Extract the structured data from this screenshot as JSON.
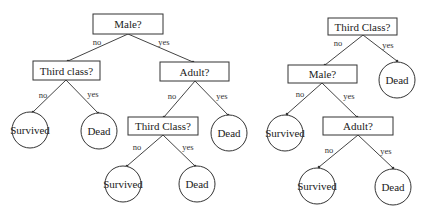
{
  "trees": [
    {
      "name": "tree-left",
      "nodes": [
        {
          "id": "male",
          "type": "decision",
          "label": "Male?"
        },
        {
          "id": "third_class_1",
          "type": "decision",
          "label": "Third class?"
        },
        {
          "id": "adult",
          "type": "decision",
          "label": "Adult?"
        },
        {
          "id": "survived_1",
          "type": "leaf",
          "label": "Survived"
        },
        {
          "id": "dead_1",
          "type": "leaf",
          "label": "Dead"
        },
        {
          "id": "third_class_2",
          "type": "decision",
          "label": "Third Class?"
        },
        {
          "id": "dead_2",
          "type": "leaf",
          "label": "Dead"
        },
        {
          "id": "survived_2",
          "type": "leaf",
          "label": "Survived"
        },
        {
          "id": "dead_3",
          "type": "leaf",
          "label": "Dead"
        }
      ],
      "edges": [
        {
          "from": "male",
          "to": "third_class_1",
          "label": "no"
        },
        {
          "from": "male",
          "to": "adult",
          "label": "yes"
        },
        {
          "from": "third_class_1",
          "to": "survived_1",
          "label": "no"
        },
        {
          "from": "third_class_1",
          "to": "dead_1",
          "label": "yes"
        },
        {
          "from": "adult",
          "to": "third_class_2",
          "label": "no"
        },
        {
          "from": "adult",
          "to": "dead_2",
          "label": "yes"
        },
        {
          "from": "third_class_2",
          "to": "survived_2",
          "label": "no"
        },
        {
          "from": "third_class_2",
          "to": "dead_3",
          "label": "yes"
        }
      ]
    },
    {
      "name": "tree-right",
      "nodes": [
        {
          "id": "third_class",
          "type": "decision",
          "label": "Third Class?"
        },
        {
          "id": "male",
          "type": "decision",
          "label": "Male?"
        },
        {
          "id": "dead_1",
          "type": "leaf",
          "label": "Dead"
        },
        {
          "id": "survived_1",
          "type": "leaf",
          "label": "Survived"
        },
        {
          "id": "adult",
          "type": "decision",
          "label": "Adult?"
        },
        {
          "id": "survived_2",
          "type": "leaf",
          "label": "Survived"
        },
        {
          "id": "dead_2",
          "type": "leaf",
          "label": "Dead"
        }
      ],
      "edges": [
        {
          "from": "third_class",
          "to": "male",
          "label": "no"
        },
        {
          "from": "third_class",
          "to": "dead_1",
          "label": "yes"
        },
        {
          "from": "male",
          "to": "survived_1",
          "label": "no"
        },
        {
          "from": "male",
          "to": "adult",
          "label": "yes"
        },
        {
          "from": "adult",
          "to": "survived_2",
          "label": "no"
        },
        {
          "from": "adult",
          "to": "dead_2",
          "label": "yes"
        }
      ]
    }
  ]
}
